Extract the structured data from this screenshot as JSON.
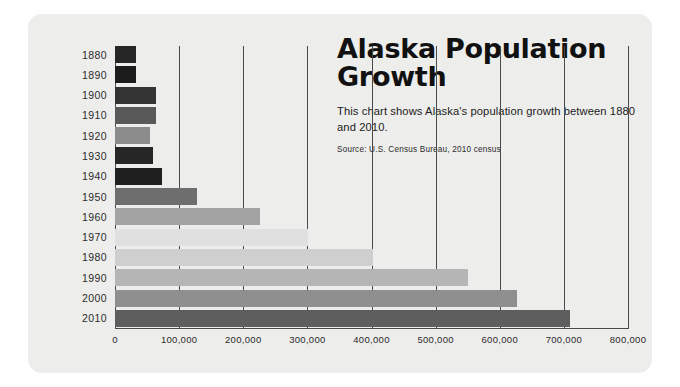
{
  "header": {
    "title": "Alaska Population Growth",
    "subtitle": "This chart shows Alaska's population growth between 1880 and 2010.",
    "source": "Source: U.S. Census Bureau, 2010 census"
  },
  "chart_data": {
    "type": "bar",
    "orientation": "horizontal",
    "title": "Alaska Population Growth",
    "subtitle": "This chart shows Alaska's population growth between 1880 and 2010.",
    "source": "Source: U.S. Census Bureau, 2010 census",
    "xlabel": "",
    "ylabel": "",
    "xlim": [
      0,
      800000
    ],
    "xticks": [
      0,
      100000,
      200000,
      300000,
      400000,
      500000,
      600000,
      700000,
      800000
    ],
    "xtick_labels": [
      "0",
      "100,000",
      "200,000",
      "300,000",
      "400,000",
      "500,000",
      "600,000",
      "700,000",
      "800,000"
    ],
    "grid": "vertical",
    "legend": "none",
    "categories": [
      "1880",
      "1890",
      "1900",
      "1910",
      "1920",
      "1930",
      "1940",
      "1950",
      "1960",
      "1970",
      "1980",
      "1990",
      "2000",
      "2010"
    ],
    "values": [
      33426,
      32052,
      63592,
      64356,
      55036,
      59278,
      72524,
      128643,
      226167,
      300382,
      401851,
      550043,
      626932,
      710231
    ],
    "bar_colors": [
      "#262626",
      "#1c1c1c",
      "#333333",
      "#595959",
      "#8c8c8c",
      "#262626",
      "#1f1f1f",
      "#6e6e6e",
      "#a3a3a3",
      "#e0e0e0",
      "#cfcfcf",
      "#b5b5b5",
      "#8f8f8f",
      "#5e5e5e"
    ],
    "bars": [
      {
        "year": "1880",
        "value": 33426,
        "color": "#262626"
      },
      {
        "year": "1890",
        "value": 32052,
        "color": "#1c1c1c"
      },
      {
        "year": "1900",
        "value": 63592,
        "color": "#333333"
      },
      {
        "year": "1910",
        "value": 64356,
        "color": "#595959"
      },
      {
        "year": "1920",
        "value": 55036,
        "color": "#8c8c8c"
      },
      {
        "year": "1930",
        "value": 59278,
        "color": "#262626"
      },
      {
        "year": "1940",
        "value": 72524,
        "color": "#1f1f1f"
      },
      {
        "year": "1950",
        "value": 128643,
        "color": "#6e6e6e"
      },
      {
        "year": "1960",
        "value": 226167,
        "color": "#a3a3a3"
      },
      {
        "year": "1970",
        "value": 300382,
        "color": "#e0e0e0"
      },
      {
        "year": "1980",
        "value": 401851,
        "color": "#cfcfcf"
      },
      {
        "year": "1990",
        "value": 550043,
        "color": "#b5b5b5"
      },
      {
        "year": "2000",
        "value": 626932,
        "color": "#8f8f8f"
      },
      {
        "year": "2010",
        "value": 710231,
        "color": "#5e5e5e"
      }
    ]
  },
  "style": {
    "card_background": "#ededeb",
    "page_background": "#ffffff",
    "axis_color": "#4a4a4a",
    "text_color": "#1c1c1c"
  }
}
